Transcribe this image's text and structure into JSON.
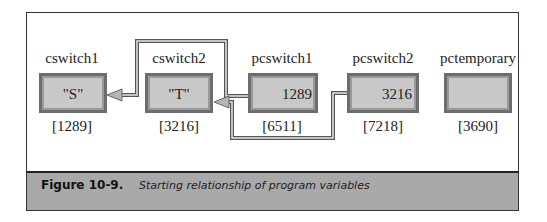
{
  "figure": {
    "label": "Figure 10-9.",
    "caption": "Starting relationship of program variables"
  },
  "variables": [
    {
      "name": "cswitch1",
      "value": "\"S\"",
      "address": "[1289]",
      "is_pointer": false
    },
    {
      "name": "cswitch2",
      "value": "\"T\"",
      "address": "[3216]",
      "is_pointer": false
    },
    {
      "name": "pcswitch1",
      "value": "1289",
      "address": "[6511]",
      "is_pointer": true,
      "points_to": "cswitch1"
    },
    {
      "name": "pcswitch2",
      "value": "3216",
      "address": "[7218]",
      "is_pointer": true,
      "points_to": "cswitch2"
    },
    {
      "name": "pctemporary",
      "value": "",
      "address": "[3690]",
      "is_pointer": false
    }
  ],
  "colors": {
    "box_fill": "#c8c8c8",
    "box_border": "#6d6d6d",
    "caption_bar": "#a9a9a9",
    "connector": "#555555"
  }
}
